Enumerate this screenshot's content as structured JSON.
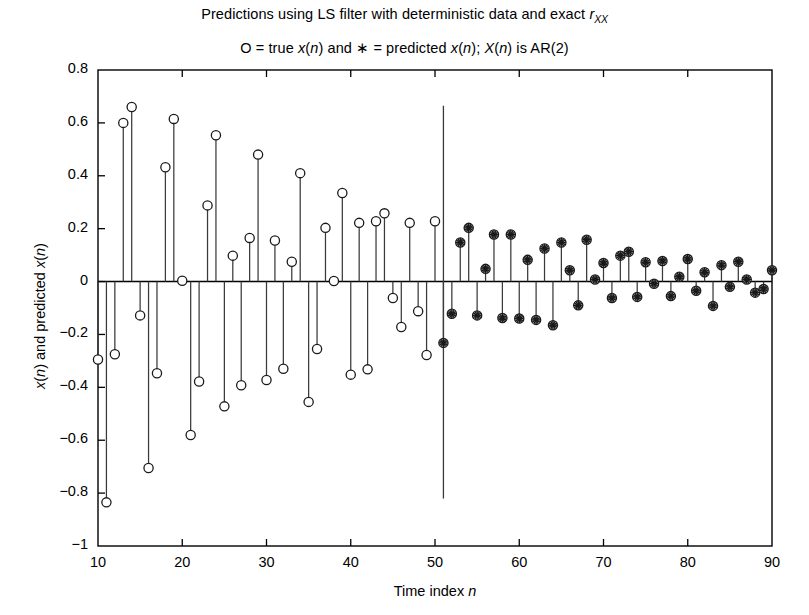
{
  "figure": {
    "title_prefix": "Predictions using LS filter with deterministic data and exact ",
    "title_var": "r",
    "title_sub": "XX",
    "subtitle_a": "O = true ",
    "subtitle_x1": "x",
    "subtitle_b": "(",
    "subtitle_n1": "n",
    "subtitle_c": ") and ",
    "subtitle_star": "∗",
    "subtitle_d": " = predicted ",
    "subtitle_x2": "x",
    "subtitle_e": "(",
    "subtitle_n2": "n",
    "subtitle_f": "); ",
    "subtitle_X": "X",
    "subtitle_g": "(",
    "subtitle_n3": "n",
    "subtitle_h": ") is AR(2)",
    "ylabel_a": "x",
    "ylabel_b": "(",
    "ylabel_n1": "n",
    "ylabel_c": ") and predicted ",
    "ylabel_d": "x",
    "ylabel_e": "(",
    "ylabel_n2": "n",
    "ylabel_f": ")",
    "xlabel_a": "Time index ",
    "xlabel_n": "n",
    "axis_color": "#000000",
    "stem_color": "#3a3a3a",
    "marker_color": "#1a1a1a"
  },
  "chart_data": {
    "type": "line",
    "plot_style": "stem",
    "subtitle": "O = true x(n) and * = predicted x(n); X(n) is AR(2)",
    "xlabel": "Time index n",
    "ylabel": "x(n) and predicted x(n)",
    "xlim": [
      10,
      90
    ],
    "ylim": [
      -1,
      0.8
    ],
    "xticks": [
      10,
      20,
      30,
      40,
      50,
      60,
      70,
      80,
      90
    ],
    "yticks": [
      -1,
      -0.8,
      -0.6,
      -0.4,
      -0.2,
      0,
      0.2,
      0.4,
      0.6,
      0.8
    ],
    "grid": false,
    "legend": "none",
    "annotations": [
      {
        "name": "prediction-start-divider",
        "type": "vline",
        "x": 51,
        "y_top": 0.665,
        "y_bottom": -0.82
      }
    ],
    "series": [
      {
        "name": "true x(n)",
        "marker": "circle",
        "x": [
          10,
          11,
          12,
          13,
          14,
          15,
          16,
          17,
          18,
          19,
          20,
          21,
          22,
          23,
          24,
          25,
          26,
          27,
          28,
          29,
          30,
          31,
          32,
          33,
          34,
          35,
          36,
          37,
          38,
          39,
          40,
          41,
          42,
          43,
          44,
          45,
          46,
          47,
          48,
          49,
          50,
          51,
          52,
          53,
          54,
          55,
          56,
          57,
          58,
          59,
          60,
          61,
          62,
          63,
          64,
          65,
          66,
          67,
          68,
          69,
          70,
          71,
          72,
          73,
          74,
          75,
          76,
          77,
          78,
          79,
          80,
          81,
          82,
          83,
          84,
          85,
          86,
          87,
          88,
          89,
          90
        ],
        "y": [
          -0.295,
          -0.835,
          -0.275,
          0.6,
          0.66,
          -0.128,
          -0.705,
          -0.347,
          0.432,
          0.615,
          0.003,
          -0.58,
          -0.378,
          0.288,
          0.553,
          -0.472,
          0.098,
          -0.392,
          0.165,
          0.48,
          -0.372,
          0.155,
          -0.33,
          0.075,
          0.41,
          -0.455,
          -0.255,
          0.203,
          0.002,
          0.335,
          -0.352,
          0.222,
          -0.332,
          0.228,
          0.258,
          -0.062,
          -0.172,
          0.222,
          -0.112,
          -0.278,
          0.228,
          -0.232,
          -0.122,
          0.148,
          0.203,
          -0.128,
          0.048,
          0.178,
          -0.138,
          0.178,
          -0.14,
          0.082,
          -0.145,
          0.125,
          -0.165,
          0.148,
          0.043,
          -0.09,
          0.158,
          0.008,
          0.07,
          -0.062,
          0.098,
          0.113,
          -0.058,
          0.073,
          -0.008,
          0.078,
          -0.055,
          0.018,
          0.085,
          -0.035,
          0.035,
          -0.092,
          0.062,
          -0.02,
          0.075,
          0.008,
          -0.042,
          -0.028,
          0.043
        ]
      },
      {
        "name": "predicted x(n)",
        "marker": "asterisk",
        "x": [
          51,
          52,
          53,
          54,
          55,
          56,
          57,
          58,
          59,
          60,
          61,
          62,
          63,
          64,
          65,
          66,
          67,
          68,
          69,
          70,
          71,
          72,
          73,
          74,
          75,
          76,
          77,
          78,
          79,
          80,
          81,
          82,
          83,
          84,
          85,
          86,
          87,
          88,
          89,
          90
        ],
        "y": [
          -0.232,
          -0.122,
          0.148,
          0.203,
          -0.128,
          0.048,
          0.178,
          -0.138,
          0.178,
          -0.14,
          0.082,
          -0.145,
          0.125,
          -0.165,
          0.148,
          0.043,
          -0.09,
          0.158,
          0.008,
          0.07,
          -0.062,
          0.098,
          0.113,
          -0.058,
          0.073,
          -0.008,
          0.078,
          -0.055,
          0.018,
          0.085,
          -0.035,
          0.035,
          -0.092,
          0.062,
          -0.02,
          0.075,
          0.008,
          -0.042,
          -0.028,
          0.043
        ]
      }
    ]
  }
}
